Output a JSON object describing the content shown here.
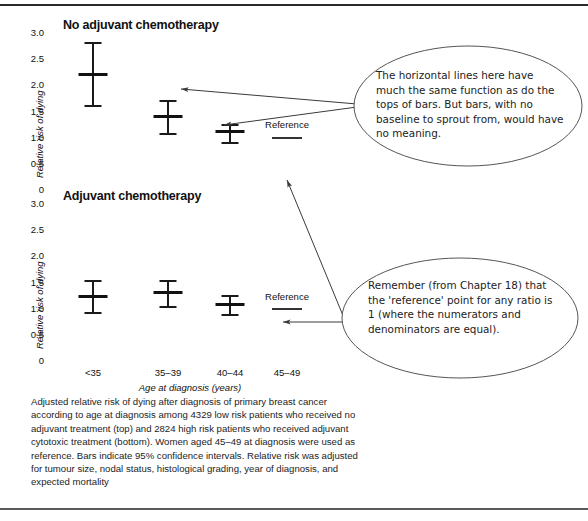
{
  "figure": {
    "caption": "Adjusted relative risk of dying after diagnosis of primary breast cancer according to age at diagnosis among 4329 low risk patients who received no adjuvant treatment (top) and 2824 high risk patients who received adjuvant cytotoxic treatment (bottom). Women aged 45–49 at diagnosis were used as reference. Bars indicate 95% confidence intervals. Relative risk was adjusted for tumour size, nodal status, histological grading, year of diagnosis, and expected mortality"
  },
  "annotations": [
    {
      "id": "callout-bars-vs-lines",
      "text": "The horizontal lines here have much the same function as do the tops of bars. But bars, with no baseline to sprout from, would have no meaning."
    },
    {
      "id": "callout-reference-point",
      "text": "Remember (from Chapter 18) that the 'reference' point for any ratio is 1 (where the numerators and denominators are equal)."
    }
  ],
  "chart_data": [
    {
      "type": "scatter",
      "id": "no-adjuvant-chemotherapy",
      "title": "No adjuvant chemotherapy",
      "xlabel": "",
      "ylabel": "Relative risk of dying",
      "categories": [
        "<35",
        "35–39",
        "40–44",
        "45–49"
      ],
      "yticks": [
        "3.0",
        "2.5",
        "2.0",
        "1.5",
        "1.0",
        "0.5",
        "0"
      ],
      "ylim": [
        0,
        3.0
      ],
      "grid": false,
      "legend": "none",
      "reference_label": "Reference",
      "reference_value": 1.0,
      "values": [
        2.22,
        1.42,
        1.12,
        1.0
      ],
      "ci_low": [
        1.62,
        1.08,
        0.92,
        null
      ],
      "ci_high": [
        2.82,
        1.72,
        1.27,
        null
      ]
    },
    {
      "type": "scatter",
      "id": "adjuvant-chemotherapy",
      "title": "Adjuvant chemotherapy",
      "xlabel": "Age at diagnosis (years)",
      "ylabel": "Relative risk of dying",
      "categories": [
        "<35",
        "35–39",
        "40–44",
        "45–49"
      ],
      "yticks": [
        "3.0",
        "2.5",
        "2.0",
        "1.5",
        "1.0",
        "0.5",
        "0"
      ],
      "ylim": [
        0,
        3.0
      ],
      "grid": false,
      "legend": "none",
      "reference_label": "Reference",
      "reference_value": 1.0,
      "values": [
        1.25,
        1.31,
        1.08,
        1.0
      ],
      "ci_low": [
        0.93,
        1.06,
        0.9,
        null
      ],
      "ci_high": [
        1.55,
        1.54,
        1.26,
        null
      ]
    }
  ],
  "colors": {
    "ink": "#1a1a1a",
    "rule": "#2b2b2b",
    "bubble_stroke": "#555555",
    "arrow": "#444444"
  }
}
